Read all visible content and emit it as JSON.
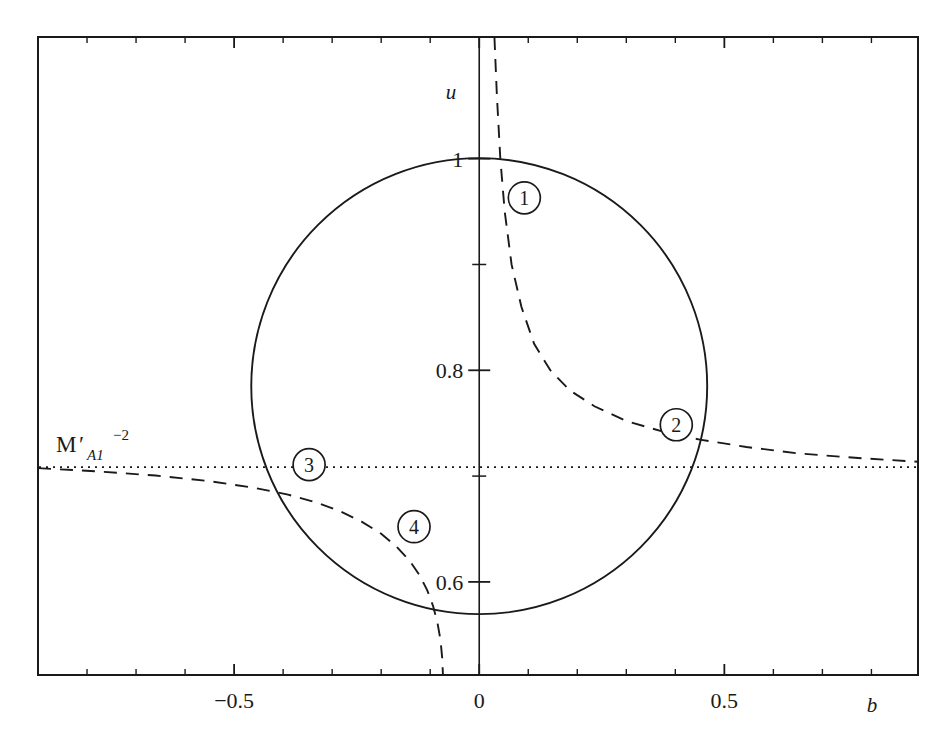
{
  "chart_data": {
    "type": "line",
    "title": "",
    "xlabel": "b",
    "ylabel": "u",
    "xlim": [
      -0.9,
      0.895
    ],
    "ylim": [
      0.512,
      1.115
    ],
    "grid": false,
    "legend": "none",
    "x_ticks": [
      {
        "value": -0.5,
        "label": "-0.5"
      },
      {
        "value": 0,
        "label": "0"
      },
      {
        "value": 0.5,
        "label": "0.5"
      }
    ],
    "x_minor_ticks": [
      -0.8,
      -0.7,
      -0.6,
      -0.4,
      -0.3,
      -0.2,
      -0.1,
      0.1,
      0.2,
      0.3,
      0.4,
      0.6,
      0.7,
      0.8
    ],
    "y_ticks": [
      {
        "value": 1.0,
        "label": "1"
      },
      {
        "value": 0.8,
        "label": "0.8"
      },
      {
        "value": 0.6,
        "label": "0.6"
      }
    ],
    "y_minor_ticks": [
      0.9,
      0.7
    ],
    "series": [
      {
        "name": "solid-closed-curve",
        "style": "solid",
        "description": "closed oval curve centred near (0, 0.785)",
        "center": [
          0.0,
          0.785
        ],
        "radius_x": 0.465,
        "radius_y": 0.2155
      },
      {
        "name": "dashed-curve-upper-right",
        "style": "dashed",
        "description": "hyperbola-like branch descending from top of frame toward the right edge",
        "points": [
          [
            0.031,
            1.115
          ],
          [
            0.036,
            1.06
          ],
          [
            0.043,
            1.0
          ],
          [
            0.052,
            0.95
          ],
          [
            0.066,
            0.9
          ],
          [
            0.086,
            0.86
          ],
          [
            0.112,
            0.825
          ],
          [
            0.145,
            0.8
          ],
          [
            0.185,
            0.781
          ],
          [
            0.235,
            0.766
          ],
          [
            0.3,
            0.752
          ],
          [
            0.375,
            0.742
          ],
          [
            0.45,
            0.7345
          ],
          [
            0.545,
            0.7275
          ],
          [
            0.65,
            0.7215
          ],
          [
            0.76,
            0.7175
          ],
          [
            0.895,
            0.7135
          ]
        ]
      },
      {
        "name": "dashed-curve-lower-left",
        "style": "dashed",
        "description": "hyperbola-like branch entering from left edge and plunging to bottom of frame",
        "points": [
          [
            -0.9,
            0.7075
          ],
          [
            -0.78,
            0.7045
          ],
          [
            -0.66,
            0.7005
          ],
          [
            -0.555,
            0.6955
          ],
          [
            -0.46,
            0.689
          ],
          [
            -0.39,
            0.6825
          ],
          [
            -0.335,
            0.6755
          ],
          [
            -0.285,
            0.667
          ],
          [
            -0.24,
            0.657
          ],
          [
            -0.2,
            0.6455
          ],
          [
            -0.168,
            0.633
          ],
          [
            -0.142,
            0.62
          ],
          [
            -0.122,
            0.6065
          ],
          [
            -0.106,
            0.592
          ],
          [
            -0.094,
            0.577
          ],
          [
            -0.085,
            0.561
          ],
          [
            -0.079,
            0.545
          ],
          [
            -0.0755,
            0.528
          ],
          [
            -0.074,
            0.512
          ]
        ]
      },
      {
        "name": "dotted-level-line",
        "style": "dotted",
        "description": "horizontal reference level",
        "y_value": 0.7085
      }
    ],
    "annotations": [
      {
        "id": "1",
        "label": "1",
        "x": 0.092,
        "y": 0.963,
        "shape": "circled-number"
      },
      {
        "id": "2",
        "label": "2",
        "x": 0.402,
        "y": 0.7485,
        "shape": "circled-number"
      },
      {
        "id": "3",
        "label": "3",
        "x": -0.347,
        "y": 0.7108,
        "shape": "circled-number"
      },
      {
        "id": "4",
        "label": "4",
        "x": -0.133,
        "y": 0.6522,
        "shape": "circled-number"
      }
    ],
    "level_label": {
      "base": "M",
      "prime": "′",
      "subscript": "A1",
      "superscript": "−2",
      "full": "M′_{A1}^{-2}",
      "x": -0.73,
      "y": 0.7365
    }
  },
  "figure": {
    "axis_label_x": "b",
    "axis_label_y": "u",
    "frame_color": "#1a1a1a",
    "curve_color": "#1a1a1a",
    "background": "#ffffff"
  }
}
